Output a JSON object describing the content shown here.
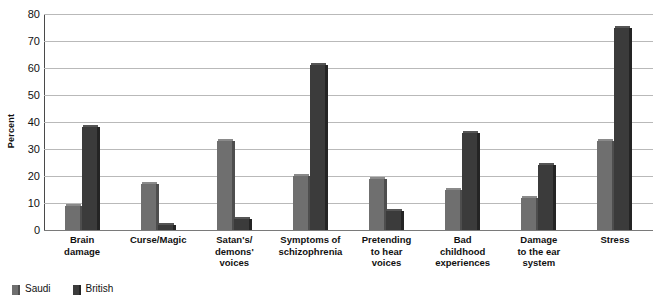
{
  "chart_data": {
    "type": "bar",
    "title": "",
    "xlabel": "",
    "ylabel": "Percent",
    "ylim": [
      0,
      80
    ],
    "yticks": [
      0,
      10,
      20,
      30,
      40,
      50,
      60,
      70,
      80
    ],
    "grid": true,
    "legend_position": "bottom-left",
    "categories": [
      "Brain damage",
      "Curse/Magic",
      "Satan's/demons' voices",
      "Symptoms of schizophrenia",
      "Pretending to hear voices",
      "Bad childhood experiences",
      "Damage to the ear system",
      "Stress"
    ],
    "category_lines": [
      [
        "Brain",
        "damage"
      ],
      [
        "Curse/Magic"
      ],
      [
        "Satan's/",
        "demons'",
        "voices"
      ],
      [
        "Symptoms of",
        "schizophrenia"
      ],
      [
        "Pretending",
        "to hear",
        "voices"
      ],
      [
        "Bad",
        "childhood",
        "experiences"
      ],
      [
        "Damage",
        "to the ear",
        "system"
      ],
      [
        "Stress"
      ]
    ],
    "series": [
      {
        "name": "Saudi",
        "color": "#6f6f6f",
        "values": [
          9,
          17,
          33,
          20,
          19,
          15,
          12,
          33
        ]
      },
      {
        "name": "British",
        "color": "#3b3b3b",
        "values": [
          38,
          2,
          4,
          61,
          7,
          36,
          24,
          75
        ]
      }
    ]
  },
  "axis": {
    "y_title": "Percent",
    "tick_0": "0",
    "tick_10": "10",
    "tick_20": "20",
    "tick_30": "30",
    "tick_40": "40",
    "tick_50": "50",
    "tick_60": "60",
    "tick_70": "70",
    "tick_80": "80"
  },
  "legend": {
    "items": [
      {
        "label": "Saudi",
        "color": "#6f6f6f"
      },
      {
        "label": "British",
        "color": "#3b3b3b"
      }
    ]
  }
}
